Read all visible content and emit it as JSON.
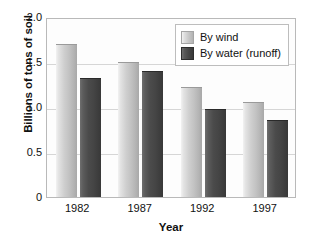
{
  "chart_data": {
    "type": "bar",
    "title": "",
    "xlabel": "Year",
    "ylabel": "Billions of tons of soil",
    "categories": [
      "1982",
      "1987",
      "1992",
      "1997"
    ],
    "series": [
      {
        "name": "By wind",
        "values": [
          1.7,
          1.5,
          1.22,
          1.06
        ],
        "color": "#c8c8c8"
      },
      {
        "name": "By water (runoff)",
        "values": [
          1.32,
          1.4,
          0.98,
          0.86
        ],
        "color": "#4a4a4a"
      }
    ],
    "ylim": [
      0,
      2.0
    ],
    "yticks": [
      "0",
      "0.5",
      "1.0",
      "1.5",
      "2.0"
    ],
    "ytick_values": [
      0,
      0.5,
      1.0,
      1.5,
      2.0
    ],
    "gridlines": [
      0.5,
      1.0,
      1.5
    ],
    "grid": true,
    "legend_position": "top-right"
  },
  "axes": {
    "y_title": "Billions of tons of soil",
    "x_title": "Year"
  },
  "legend": {
    "entries": [
      {
        "label": "By wind"
      },
      {
        "label": "By water (runoff)"
      }
    ]
  },
  "title_fragment": ""
}
